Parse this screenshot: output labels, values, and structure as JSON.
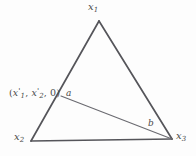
{
  "figure": {
    "type": "geometry-diagram",
    "shape": "triangle",
    "background_color": "#fdfdfd",
    "stroke_color": "#55555a",
    "cevian_stroke_color": "#6a6a70",
    "text_color": "#4a4a4a",
    "vertices": [
      {
        "id": "x1",
        "label_main": "x",
        "label_sub": "1",
        "x": 99,
        "y": 21,
        "label_x": 88,
        "label_y": 2
      },
      {
        "id": "x2",
        "label_main": "x",
        "label_sub": "2",
        "x": 31,
        "y": 141,
        "label_x": 14,
        "label_y": 132
      },
      {
        "id": "x3",
        "label_main": "x",
        "label_sub": "3",
        "x": 172,
        "y": 139,
        "label_x": 176,
        "label_y": 131
      }
    ],
    "interior_point": {
      "id": "x-prime",
      "x": 61,
      "y": 96,
      "label_open": "(",
      "label_var1": "x",
      "label_prime1": "'",
      "label_sub1": "1",
      "label_sep1": ", ",
      "label_var2": "x",
      "label_prime2": "'",
      "label_sub2": "2",
      "label_sep2": ", ",
      "label_zero": "0",
      "label_close": ")"
    },
    "angle_markers": [
      {
        "id": "a",
        "label": "a",
        "x": 66,
        "y": 89
      },
      {
        "id": "b",
        "label": "b",
        "x": 148,
        "y": 119
      }
    ],
    "edges": [
      {
        "id": "edge-x1-x2",
        "from": "x1",
        "to": "x2"
      },
      {
        "id": "edge-x1-x3",
        "from": "x1",
        "to": "x3"
      },
      {
        "id": "edge-x2-x3",
        "from": "x2",
        "to": "x3"
      }
    ],
    "cevian": {
      "id": "cevian-xprime-x3",
      "from": "x-prime",
      "to": "x3"
    }
  }
}
